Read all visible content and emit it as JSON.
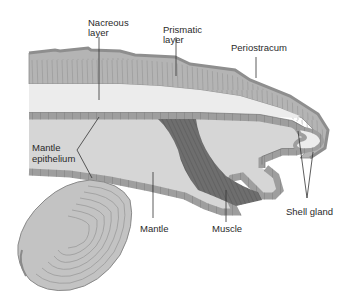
{
  "diagram": {
    "labels": {
      "nacreous": [
        "Nacreous",
        "layer"
      ],
      "prismatic": [
        "Prismatic",
        "layer"
      ],
      "periostracum": "Periostracum",
      "mantle_epithelium": [
        "Mantle",
        "epithelium"
      ],
      "mantle": "Mantle",
      "muscle": "Muscle",
      "shell_gland": "Shell gland"
    },
    "colors": {
      "periostracum": "#9a9a9a",
      "prismatic": "#b4b4b4",
      "nacreous": "#ececec",
      "epithelium": "#9e9e9e",
      "epithelium_cell_line": "#6f6f6f",
      "mantle": "#d6d6d6",
      "muscle": "#6e6e6e",
      "clam_shell": "#c3c3c3",
      "leader_line": "#333333",
      "text": "#2a2a2a"
    }
  }
}
